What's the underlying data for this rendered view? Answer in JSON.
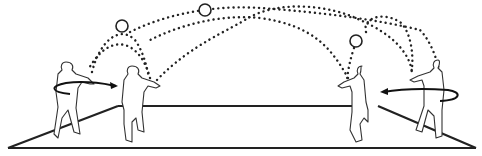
{
  "diagram": {
    "type": "ball-passing drill illustration",
    "court": {
      "shape": "trapezoid floor",
      "corners": [
        [
          8,
          148
        ],
        [
          474,
          148
        ],
        [
          398,
          104
        ],
        [
          118,
          104
        ]
      ]
    },
    "players": [
      {
        "id": "player-1",
        "position": "far-left",
        "facing": "right",
        "rotation_arrow": "counter-clockwise toward right"
      },
      {
        "id": "player-2",
        "position": "center-left",
        "facing": "right"
      },
      {
        "id": "player-3",
        "position": "center-right",
        "facing": "left"
      },
      {
        "id": "player-4",
        "position": "far-right",
        "facing": "left",
        "rotation_arrow": "clockwise toward left"
      }
    ],
    "balls": [
      {
        "id": "ball-1",
        "cx": 122,
        "cy": 26
      },
      {
        "id": "ball-2",
        "cx": 205,
        "cy": 10
      },
      {
        "id": "ball-3",
        "cx": 356,
        "cy": 41
      }
    ],
    "trajectories": [
      {
        "from": "player-2",
        "to": "player-1",
        "style": "dotted arc"
      },
      {
        "from": "player-1",
        "to": "player-2",
        "style": "dotted arc",
        "via": "ball-1"
      },
      {
        "from": "player-2",
        "to": "player-4",
        "style": "dotted arc"
      },
      {
        "from": "player-1",
        "to": "player-4",
        "style": "dotted arc",
        "via": "ball-2"
      },
      {
        "from": "player-4",
        "to": "player-3",
        "style": "dotted arc",
        "via": "ball-3"
      },
      {
        "from": "player-3",
        "to": "player-1",
        "style": "dotted arc"
      }
    ],
    "colors": {
      "lines": "#222222",
      "background": "#ffffff"
    }
  }
}
